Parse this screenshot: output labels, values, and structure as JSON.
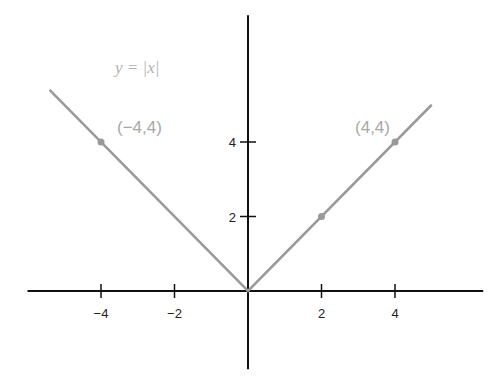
{
  "chart_data": {
    "type": "line",
    "title": "",
    "function_label": "y = |x|",
    "xlabel": "",
    "ylabel": "",
    "xlim": [
      -6.0,
      6.4
    ],
    "ylim": [
      -2.1,
      7.4
    ],
    "grid": false,
    "x_ticks": [
      {
        "value": -4,
        "label": "−4"
      },
      {
        "value": -2,
        "label": "−2"
      },
      {
        "value": 2,
        "label": "2"
      },
      {
        "value": 4,
        "label": "4"
      }
    ],
    "y_ticks": [
      {
        "value": 2,
        "label": "2"
      },
      {
        "value": 4,
        "label": "4"
      }
    ],
    "series": [
      {
        "name": "y = |x|",
        "color": "#9a9a9a",
        "x": [
          -5.4,
          0,
          5.0
        ],
        "y": [
          5.4,
          0,
          5.0
        ]
      }
    ],
    "points": [
      {
        "x": -4,
        "y": 4,
        "label": "(−4,4)"
      },
      {
        "x": 2,
        "y": 2,
        "label": ""
      },
      {
        "x": 4,
        "y": 4,
        "label": "(4,4)"
      }
    ]
  }
}
